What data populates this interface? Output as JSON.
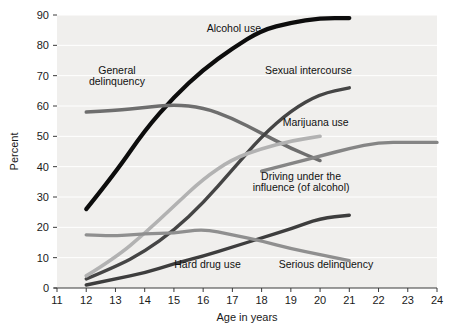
{
  "chart_data": {
    "type": "line",
    "title": "",
    "xlabel": "Age in years",
    "ylabel": "Percent",
    "xlim": [
      11,
      24
    ],
    "ylim": [
      0,
      90
    ],
    "grid": true,
    "legend_position": "inline-labels",
    "xticks": [
      "11",
      "12",
      "13",
      "14",
      "15",
      "16",
      "17",
      "18",
      "19",
      "20",
      "21",
      "22",
      "23",
      "24"
    ],
    "yticks": [
      "0",
      "10",
      "20",
      "30",
      "40",
      "50",
      "60",
      "70",
      "80",
      "90"
    ],
    "background_color": "#f0efed",
    "gridline_color": "#ffffff",
    "series": [
      {
        "name": "Alcohol use",
        "color": "#0d0d0d",
        "width": 4.2,
        "label_x": 17.05,
        "label_y": 84.5,
        "label_anchor": "middle",
        "x": [
          12,
          13,
          14,
          15,
          16,
          17,
          18,
          19,
          20,
          21
        ],
        "values": [
          26,
          38,
          52,
          63,
          72,
          79,
          85,
          87.5,
          89,
          89
        ]
      },
      {
        "name": "General delinquency",
        "color": "#6e6e6e",
        "width": 3.4,
        "label_x": 13.05,
        "label_y": 70.5,
        "label_anchor": "middle",
        "label_line2_offset": 11,
        "x": [
          12,
          13,
          14,
          15,
          16,
          17,
          18,
          19,
          20
        ],
        "values": [
          58,
          58.5,
          59.5,
          60.5,
          59.5,
          56,
          51,
          46,
          42
        ]
      },
      {
        "name": "Sexual intercourse",
        "color": "#454545",
        "width": 3.4,
        "label_x": 19.6,
        "label_y": 70.5,
        "label_anchor": "middle",
        "x": [
          12,
          13,
          14,
          15,
          16,
          17,
          18,
          19,
          20,
          21
        ],
        "values": [
          3,
          7,
          12,
          19,
          28,
          39,
          50,
          58.5,
          64,
          66
        ]
      },
      {
        "name": "Marijuana use",
        "color": "#b2b2b2",
        "width": 3.6,
        "label_x": 19.85,
        "label_y": 53.5,
        "label_anchor": "middle",
        "x": [
          12,
          13,
          14,
          15,
          16,
          17,
          18,
          19,
          20
        ],
        "values": [
          4,
          10,
          18,
          27,
          36,
          42.5,
          46,
          48.5,
          50
        ]
      },
      {
        "name": "Driving under the influence (of alcohol)",
        "color": "#858585",
        "width": 3.4,
        "label_x": 19.35,
        "label_y": 35.5,
        "label_anchor": "middle",
        "label_line2_offset": 11,
        "label_text_1": "Driving under the",
        "label_text_2": "influence (of alcohol)",
        "x": [
          18,
          19,
          20,
          21,
          22,
          23,
          24
        ],
        "values": [
          38.5,
          41,
          43.5,
          46,
          48,
          48,
          48
        ]
      },
      {
        "name": "Hard drug use",
        "color": "#3d3d3d",
        "width": 3.4,
        "label_x": 16.15,
        "label_y": 6.5,
        "label_anchor": "middle",
        "x": [
          12,
          13,
          14,
          15,
          16,
          17,
          18,
          19,
          20,
          21
        ],
        "values": [
          1,
          3,
          5,
          8,
          10.5,
          13.5,
          16.5,
          19.5,
          23,
          24
        ]
      },
      {
        "name": "Serious delinquency",
        "color": "#8f8f8f",
        "width": 3.4,
        "label_x": 20.2,
        "label_y": 6.5,
        "label_anchor": "middle",
        "x": [
          12,
          13,
          14,
          15,
          16,
          17,
          18,
          19,
          20,
          21
        ],
        "values": [
          17.5,
          17,
          18,
          18,
          19.5,
          17.5,
          15.5,
          13,
          11,
          9
        ]
      }
    ]
  }
}
